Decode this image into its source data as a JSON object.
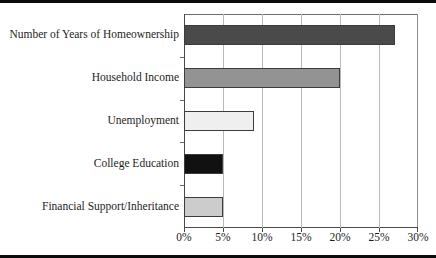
{
  "chart_data": {
    "type": "bar",
    "orientation": "horizontal",
    "title": "",
    "subtitle": "",
    "xlabel": "",
    "ylabel": "",
    "categories": [
      "Number of Years of Homeownership",
      "Household Income",
      "Unemployment",
      "College Education",
      "Financial Support/Inheritance"
    ],
    "values": [
      27,
      20,
      9,
      5,
      5
    ],
    "value_unit": "%",
    "xlim": [
      0,
      30
    ],
    "xticks": [
      0,
      5,
      10,
      15,
      20,
      25,
      30
    ],
    "xtick_labels": [
      "0%",
      "5%",
      "10%",
      "15%",
      "20%",
      "25%",
      "30%"
    ],
    "grid": "vertical",
    "legend": "none",
    "bar_colors": [
      "#4a4a4a",
      "#939393",
      "#efefef",
      "#111111",
      "#cccccc"
    ],
    "bar_edge_color": "#3c3c3c",
    "axis_color": "#4a4a4a",
    "gridline_color": "#b9b9b9",
    "background": "#ffffff",
    "annotations": []
  }
}
